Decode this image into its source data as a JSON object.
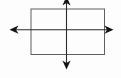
{
  "diagram": {
    "canvas": {
      "width": 121,
      "height": 78,
      "background": "#fdfdfd"
    },
    "rectangle": {
      "x": 31,
      "y": 9,
      "width": 73.5,
      "height": 45.5,
      "stroke": "#5f5f5f",
      "stroke_width": 1,
      "fill": "none"
    },
    "horizontal_axis": {
      "x1": 13,
      "y1": 29.7,
      "x2": 109,
      "y2": 29.7,
      "stroke": "#2a2a2a",
      "stroke_width": 1.1
    },
    "vertical_axis": {
      "x1": 66.5,
      "y1": 1,
      "x2": 66.5,
      "y2": 64,
      "stroke": "#2a2a2a",
      "stroke_width": 1.1
    },
    "arrowheads": {
      "fill": "#141414",
      "left_points": "9.5,29.7 18.5,25.6 16,29.7 18.5,33.8",
      "right_points": "113.5,29.7 104.5,25.6 107,29.7 104.5,33.8",
      "top_points": "66.5,-3.5 62.4,5.5 66.5,3 70.6,5.5",
      "bottom_points": "66.5,69.5 62.4,60.5 66.5,63 70.6,60.5"
    }
  }
}
